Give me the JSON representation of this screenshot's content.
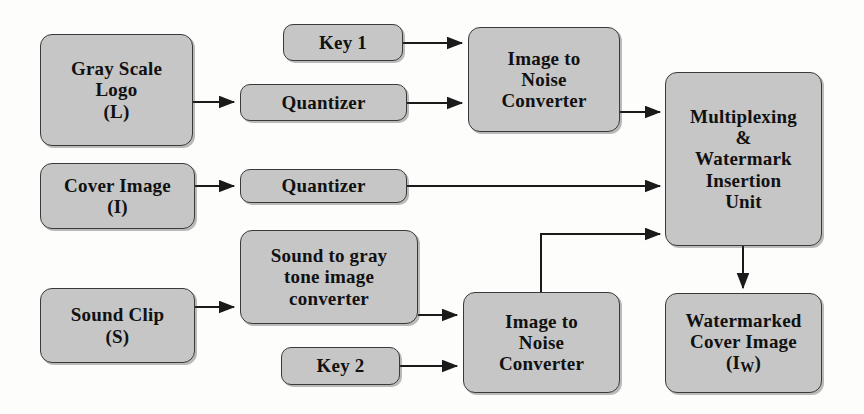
{
  "diagram": {
    "style": {
      "node_fill": "#c6c6c6",
      "node_stroke": "#3a3a3a",
      "edge_color": "#1a1a1a",
      "background": "#fdfdfb",
      "text_color": "#111111"
    },
    "nodes": [
      {
        "id": "gray-scale-logo",
        "label": "Gray Scale\nLogo\n(L)",
        "x": 40,
        "y": 34,
        "w": 153,
        "h": 112,
        "font_size": 19
      },
      {
        "id": "key-1",
        "label": "Key 1",
        "x": 283,
        "y": 24,
        "w": 120,
        "h": 37,
        "font_size": 19
      },
      {
        "id": "quantizer-logo",
        "label": "Quantizer",
        "x": 240,
        "y": 84,
        "w": 167,
        "h": 37,
        "font_size": 19
      },
      {
        "id": "image-to-noise-converter-top",
        "label": "Image to\nNoise\nConverter",
        "x": 468,
        "y": 27,
        "w": 152,
        "h": 105,
        "font_size": 19
      },
      {
        "id": "multiplexing-watermark-insertion-unit",
        "label": "Multiplexing\n&\nWatermark\nInsertion\nUnit",
        "x": 665,
        "y": 72,
        "w": 157,
        "h": 174,
        "font_size": 19
      },
      {
        "id": "cover-image",
        "label": "Cover Image\n(I)",
        "x": 40,
        "y": 163,
        "w": 155,
        "h": 66,
        "font_size": 19
      },
      {
        "id": "quantizer-cover",
        "label": "Quantizer",
        "x": 240,
        "y": 169,
        "w": 167,
        "h": 34,
        "font_size": 19
      },
      {
        "id": "sound-to-gray-tone-image-converter",
        "label": "Sound to gray\ntone image\nconverter",
        "x": 240,
        "y": 230,
        "w": 178,
        "h": 94,
        "font_size": 19
      },
      {
        "id": "sound-clip",
        "label": "Sound Clip\n(S)",
        "x": 40,
        "y": 288,
        "w": 155,
        "h": 75,
        "font_size": 19
      },
      {
        "id": "key-2",
        "label": "Key 2",
        "x": 281,
        "y": 347,
        "w": 119,
        "h": 38,
        "font_size": 19
      },
      {
        "id": "image-to-noise-converter-bottom",
        "label": "Image to\nNoise\nConverter",
        "x": 463,
        "y": 292,
        "w": 157,
        "h": 101,
        "font_size": 19
      },
      {
        "id": "watermarked-cover-image",
        "label": "Watermarked\nCover Image\n(I<sub>W</sub>)",
        "html": true,
        "x": 665,
        "y": 293,
        "w": 157,
        "h": 100,
        "font_size": 19
      }
    ],
    "edges": [
      {
        "id": "logo-to-quantizer",
        "from": "gray-scale-logo",
        "to": "quantizer-logo",
        "type": "straight"
      },
      {
        "id": "key1-to-converter",
        "from": "key-1",
        "to": "image-to-noise-converter-top",
        "type": "straight"
      },
      {
        "id": "quantizer-logo-to-converter",
        "from": "quantizer-logo",
        "to": "image-to-noise-converter-top",
        "type": "straight"
      },
      {
        "id": "converter-to-multiplexer",
        "from": "image-to-noise-converter-top",
        "to": "multiplexing-watermark-insertion-unit",
        "type": "straight"
      },
      {
        "id": "cover-to-quantizer",
        "from": "cover-image",
        "to": "quantizer-cover",
        "type": "straight"
      },
      {
        "id": "quantizer-cover-to-mux",
        "from": "quantizer-cover",
        "to": "multiplexing-watermark-insertion-unit",
        "type": "straight"
      },
      {
        "id": "sound-to-converter",
        "from": "sound-clip",
        "to": "sound-to-gray-tone-image-converter",
        "type": "straight"
      },
      {
        "id": "gray-tone-to-noise",
        "from": "sound-to-gray-tone-image-converter",
        "to": "image-to-noise-converter-bottom",
        "type": "straight"
      },
      {
        "id": "key2-to-noise",
        "from": "key-2",
        "to": "image-to-noise-converter-bottom",
        "type": "straight"
      },
      {
        "id": "noise-bottom-to-mux",
        "from": "image-to-noise-converter-bottom",
        "to": "multiplexing-watermark-insertion-unit",
        "type": "elbow-up"
      },
      {
        "id": "mux-to-watermarked",
        "from": "multiplexing-watermark-insertion-unit",
        "to": "watermarked-cover-image",
        "type": "vertical-down"
      }
    ]
  }
}
